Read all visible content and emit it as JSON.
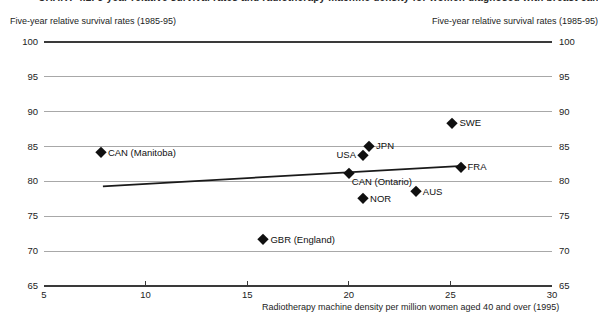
{
  "title_partial": "CHART 4.2. 5-year relative survival rates and radiotherapy machine density for women diagnosed with breast cancer",
  "left_axis_header": "Five-year relative survival rates (1985-95)",
  "right_axis_header": "Five-year relative survival rates (1985-95)",
  "colors": {
    "point": "#101010",
    "grid": "#a8a8a8",
    "axis_dark": "#3a3a3a",
    "trend": "#1a1a1a"
  },
  "chart_data": {
    "type": "scatter",
    "xlabel": "Radiotherapy machine density per million women aged 40 and over (1995)",
    "ylabel": "Five-year relative survival rates (1985-95)",
    "xlim": [
      5,
      30
    ],
    "ylim": [
      65,
      100
    ],
    "x_ticks": [
      5,
      10,
      15,
      20,
      25,
      30
    ],
    "y_ticks": [
      100,
      95,
      90,
      85,
      80,
      75,
      70,
      65
    ],
    "grid": true,
    "points": [
      {
        "label": "CAN (Manitoba)",
        "x": 7.8,
        "y": 84.2,
        "label_pos": "right"
      },
      {
        "label": "GBR (England)",
        "x": 15.8,
        "y": 71.7,
        "label_pos": "right"
      },
      {
        "label": "CAN (Ontario)",
        "x": 20.0,
        "y": 81.2,
        "label_pos": "below-right"
      },
      {
        "label": "NOR",
        "x": 20.7,
        "y": 77.6,
        "label_pos": "right"
      },
      {
        "label": "USA",
        "x": 20.7,
        "y": 83.8,
        "label_pos": "left"
      },
      {
        "label": "JPN",
        "x": 21.0,
        "y": 85.1,
        "label_pos": "right"
      },
      {
        "label": "AUS",
        "x": 23.3,
        "y": 78.6,
        "label_pos": "right"
      },
      {
        "label": "SWE",
        "x": 25.1,
        "y": 88.4,
        "label_pos": "right"
      },
      {
        "label": "FRA",
        "x": 25.5,
        "y": 82.1,
        "label_pos": "right"
      }
    ],
    "trend_line": {
      "x1": 7.9,
      "y1": 79.3,
      "x2": 25.4,
      "y2": 82.2
    }
  }
}
